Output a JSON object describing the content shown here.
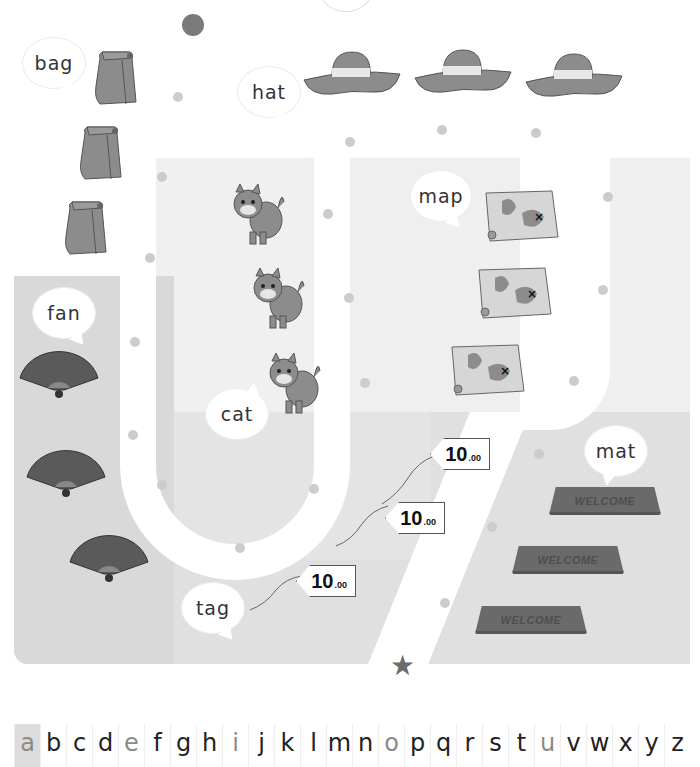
{
  "worksheet": {
    "words": {
      "bag": "bag",
      "hat": "hat",
      "map": "map",
      "fan": "fan",
      "cat": "cat",
      "tag": "tag",
      "mat": "mat"
    },
    "tags": [
      {
        "price_main": "10",
        "price_cents": ".00"
      },
      {
        "price_main": "10",
        "price_cents": ".00"
      },
      {
        "price_main": "10",
        "price_cents": ".00"
      }
    ],
    "mats": [
      {
        "label": "WELCOME"
      },
      {
        "label": "WELCOME"
      },
      {
        "label": "WELCOME"
      }
    ],
    "start_marker": "start-dot",
    "end_marker": "end-star"
  },
  "alphabet": {
    "letters": [
      "a",
      "b",
      "c",
      "d",
      "e",
      "f",
      "g",
      "h",
      "i",
      "j",
      "k",
      "l",
      "m",
      "n",
      "o",
      "p",
      "q",
      "r",
      "s",
      "t",
      "u",
      "v",
      "w",
      "x",
      "y",
      "z"
    ],
    "vowels": [
      "a",
      "e",
      "i",
      "o",
      "u"
    ],
    "highlighted": "a"
  },
  "colors": {
    "dot": "#cccccc",
    "start_dot": "#7a7a7a",
    "star": "#6c6c6c",
    "object_gray": "#8c8c8c",
    "panel_gray": "#d9d9d9"
  }
}
